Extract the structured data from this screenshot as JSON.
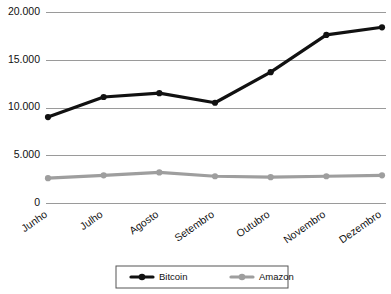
{
  "chart_data": {
    "type": "line",
    "title": "",
    "xlabel": "",
    "ylabel": "",
    "categories": [
      "Junho",
      "Julho",
      "Agosto",
      "Setembro",
      "Outubro",
      "Novembro",
      "Dezembro"
    ],
    "series": [
      {
        "name": "Bitcoin",
        "color": "#111111",
        "values": [
          9000,
          11100,
          11500,
          10500,
          13700,
          17600,
          18400
        ]
      },
      {
        "name": "Amazon",
        "color": "#9e9e9e",
        "values": [
          2600,
          2900,
          3200,
          2800,
          2700,
          2800,
          2900
        ]
      }
    ],
    "ylim": [
      0,
      20000
    ],
    "yticks": [
      0,
      5000,
      10000,
      15000,
      20000
    ],
    "ytick_labels": [
      "0",
      "5.000",
      "10.000",
      "15.000",
      "20.000"
    ],
    "grid": true,
    "grid_axis": "y",
    "legend_position": "bottom",
    "marker": "circle",
    "xtick_rotation": -35
  },
  "legend": {
    "items": [
      {
        "label": "Bitcoin",
        "color": "#111111"
      },
      {
        "label": "Amazon",
        "color": "#9e9e9e"
      }
    ]
  },
  "colors": {
    "background": "#ffffff",
    "gridline": "#9a9a9a",
    "text": "#111111",
    "bitcoin": "#111111",
    "amazon": "#9e9e9e",
    "legend_border": "#555555"
  }
}
